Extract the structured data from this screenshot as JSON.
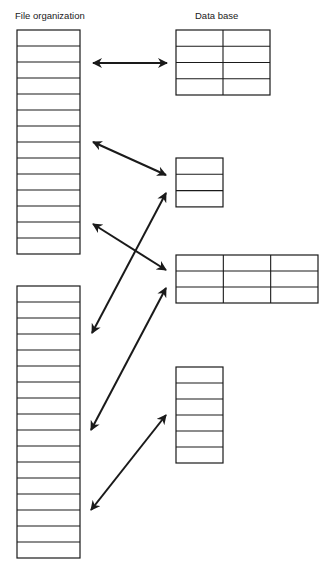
{
  "titles": {
    "file_organization": "File organization",
    "data_base": "Data base"
  },
  "file_blocks": [
    {
      "name": "file-block-1",
      "rows": 14
    },
    {
      "name": "file-block-2",
      "rows": 17
    }
  ],
  "database_tables": [
    {
      "name": "db-table-1",
      "rows": 4,
      "cols": 2
    },
    {
      "name": "db-table-2",
      "rows": 3,
      "cols": 1
    },
    {
      "name": "db-table-3",
      "rows": 3,
      "cols": 3
    },
    {
      "name": "db-table-4",
      "rows": 6,
      "cols": 1
    }
  ],
  "arrows": [
    {
      "name": "arrow-file-to-table-1",
      "type": "bidirectional"
    },
    {
      "name": "arrow-file-to-table-2",
      "type": "bidirectional"
    },
    {
      "name": "arrow-file-to-table-3",
      "type": "bidirectional"
    },
    {
      "name": "arrow-table-2-to-file-block-2",
      "type": "bidirectional"
    },
    {
      "name": "arrow-table-3-to-file-block-2",
      "type": "bidirectional"
    },
    {
      "name": "arrow-table-4-to-file-block-2",
      "type": "bidirectional"
    }
  ],
  "colors": {
    "line": "#1a1a1a",
    "background": "#ffffff"
  }
}
